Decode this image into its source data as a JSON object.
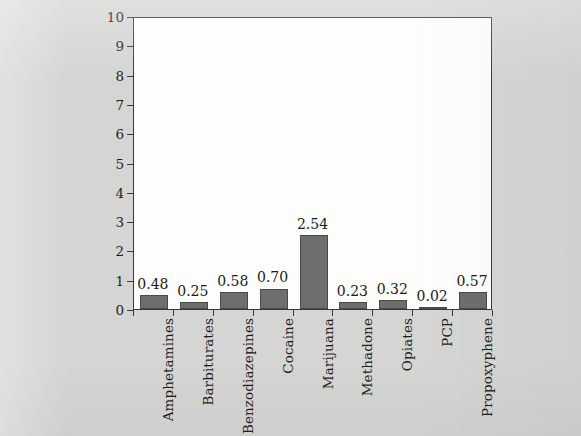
{
  "chart_data": {
    "type": "bar",
    "title": "",
    "xlabel": "",
    "ylabel": "% of applicants",
    "ylim": [
      0,
      10
    ],
    "yticks": [
      0,
      1,
      2,
      3,
      4,
      5,
      6,
      7,
      8,
      9,
      10
    ],
    "ytick_labels": [
      "0",
      "1",
      "2",
      "3",
      "4",
      "5",
      "6",
      "7",
      "8",
      "9",
      "10"
    ],
    "grid": false,
    "legend": false,
    "bar_color": "#6e6e6e",
    "bar_edge_color": "#4a4a4a",
    "plot_background": "#fdfdfc",
    "figure_background": "#d5d5d4",
    "axis_color": "#3a3a3a",
    "categories": [
      "Amphetamines",
      "Barbiturates",
      "Benzodiazepines",
      "Cocaine",
      "Marijuana",
      "Methadone",
      "Opiates",
      "PCP",
      "Propoxyphene"
    ],
    "values": [
      0.48,
      0.25,
      0.58,
      0.7,
      2.54,
      0.23,
      0.32,
      0.02,
      0.57
    ],
    "value_labels": [
      "0.48",
      "0.25",
      "0.58",
      "0.70",
      "2.54",
      "0.23",
      "0.32",
      "0.02",
      "0.57"
    ]
  }
}
